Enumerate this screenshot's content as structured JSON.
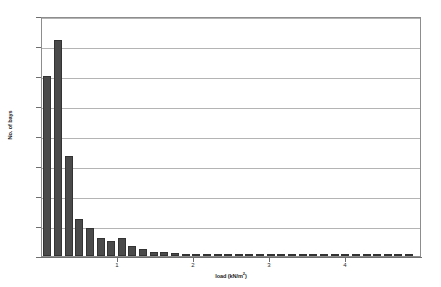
{
  "chart_data": {
    "type": "bar",
    "title": "",
    "subtitle": "",
    "xlabel": "load (kN/m²)",
    "ylabel": "No. of bays",
    "xlim": [
      0,
      5
    ],
    "ylim": [
      0,
      1600
    ],
    "ytick_values": [
      0,
      200,
      400,
      600,
      800,
      1000,
      1200,
      1400,
      1600
    ],
    "ytick_labels": [
      "0",
      "200",
      "400",
      "600",
      "800",
      "1000",
      "1200",
      "1400",
      "1600"
    ],
    "xtick_values": [
      1,
      2,
      3,
      4
    ],
    "xtick_labels": [
      "1",
      "2",
      "3",
      "4"
    ],
    "grid": "horizontal",
    "legend": "none",
    "bar_color": "#4a4a4a",
    "bar_edge_color": "#333333",
    "gridline_color": "#b4b4b4",
    "axis_color": "#6e6e6e",
    "bin_width": 0.14,
    "categories": [
      0.07,
      0.21,
      0.35,
      0.49,
      0.63,
      0.77,
      0.91,
      1.05,
      1.19,
      1.33,
      1.47,
      1.61,
      1.75,
      1.89,
      2.03,
      2.17,
      2.31,
      2.45,
      2.59,
      2.73,
      2.87,
      3.01,
      3.15,
      3.29,
      3.43,
      3.57,
      3.71,
      3.85,
      3.99,
      4.13,
      4.27,
      4.41,
      4.55,
      4.69,
      4.83
    ],
    "values": [
      1200,
      1440,
      670,
      250,
      190,
      120,
      100,
      120,
      65,
      45,
      30,
      30,
      18,
      12,
      10,
      8,
      6,
      5,
      4,
      4,
      3,
      3,
      2,
      2,
      2,
      2,
      1,
      1,
      1,
      1,
      1,
      1,
      1,
      1,
      1
    ]
  }
}
